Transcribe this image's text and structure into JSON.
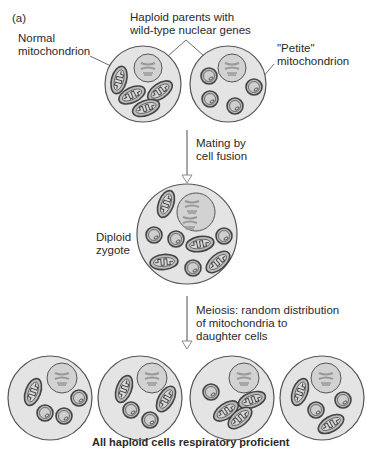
{
  "figure": {
    "panel_label": "(a)",
    "labels": {
      "haploid_parents": [
        "Haploid parents with",
        "wild-type nuclear genes"
      ],
      "normal_mito": [
        "Normal",
        "mitochondrion"
      ],
      "petite_mito": [
        "\"Petite\"",
        "mitochondrion"
      ],
      "mating": [
        "Mating by",
        "cell fusion"
      ],
      "diploid": [
        "Diploid",
        "zygote"
      ],
      "meiosis": [
        "Meiosis: random distribution",
        "of mitochondria to",
        "daughter cells"
      ],
      "conclusion": "All haploid cells respiratory proficient"
    },
    "colors": {
      "cell_fill": "#e4e4e4",
      "nucleus_fill": "#d2d2d2",
      "outline": "#555555",
      "mito_fill": "#bdbdbd",
      "arrow": "#8a8a8a"
    },
    "stages": [
      {
        "name": "haploid-parent-normal",
        "mitochondria": "normal",
        "count": 4
      },
      {
        "name": "haploid-parent-petite",
        "mitochondria": "petite",
        "count": 4
      },
      {
        "name": "diploid-zygote",
        "mitochondria": "mixed",
        "count": 8
      },
      {
        "name": "daughter-cell-1",
        "normal": 1,
        "petite": 3
      },
      {
        "name": "daughter-cell-2",
        "normal": 2,
        "petite": 2
      },
      {
        "name": "daughter-cell-3",
        "normal": 2,
        "petite": 1
      },
      {
        "name": "daughter-cell-4",
        "normal": 2,
        "petite": 2
      }
    ]
  }
}
